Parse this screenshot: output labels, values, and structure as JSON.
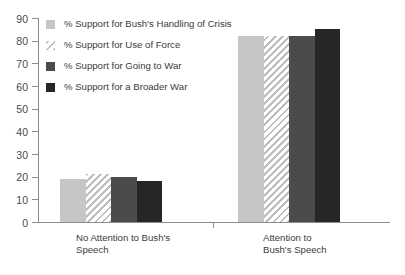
{
  "chart_data": {
    "type": "bar",
    "title": "",
    "subtitle": "",
    "xlabel": "",
    "ylabel": "",
    "ylim": [
      0,
      90
    ],
    "ytick_labels": [
      "90",
      "80",
      "70",
      "60",
      "50",
      "40",
      "30",
      "20",
      "10",
      "0"
    ],
    "ytick_values": [
      90,
      80,
      70,
      60,
      50,
      40,
      30,
      20,
      10,
      0
    ],
    "grid": false,
    "legend_position": "top-left inside plot",
    "categories": [
      "No Attention to Bush's Speech",
      "Attention to Bush's Speech"
    ],
    "category_lines": [
      [
        "No Attention to Bush's",
        "Speech"
      ],
      [
        "Attention to",
        "Bush's Speech"
      ]
    ],
    "series": [
      {
        "name": "% Support for Bush's Handling of Crisis",
        "values": [
          19,
          82
        ],
        "fill": "solid",
        "color": "#c6c6c6"
      },
      {
        "name": "% Support for Use of Force",
        "values": [
          21,
          82
        ],
        "fill": "hatched-diagonal",
        "color": "#bdbdbd"
      },
      {
        "name": "% Support for Going to War",
        "values": [
          20,
          82
        ],
        "fill": "solid",
        "color": "#4b4b4b"
      },
      {
        "name": "% Support for a Broader War",
        "values": [
          18,
          85
        ],
        "fill": "solid",
        "color": "#262626"
      }
    ]
  },
  "axis": {
    "line_color": "#8c8c8c",
    "text_color": "#3b3b3b"
  }
}
